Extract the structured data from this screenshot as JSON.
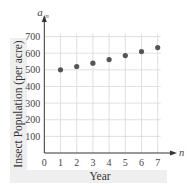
{
  "chart_data": {
    "type": "scatter",
    "title": "",
    "xlabel": "Year",
    "ylabel": "Insect Population (per acre)",
    "x_axis_symbol": "n",
    "y_axis_symbol": "a",
    "y_axis_symbol_sub": "n",
    "x": [
      1,
      2,
      3,
      4,
      5,
      6,
      7
    ],
    "series": [
      {
        "name": "a_n",
        "values": [
          500,
          520,
          540,
          562,
          586,
          610,
          634
        ]
      }
    ],
    "x_ticks": [
      "0",
      "1",
      "2",
      "3",
      "4",
      "5",
      "6",
      "7"
    ],
    "y_ticks": [
      "100",
      "200",
      "300",
      "400",
      "500",
      "600",
      "700"
    ],
    "xlim": [
      0,
      7
    ],
    "ylim": [
      0,
      700
    ],
    "grid": true,
    "legend": null,
    "colors": {
      "point": "#555555",
      "grid": "#d8d8d8",
      "axis": "#333333",
      "label_band": "#efefef"
    }
  }
}
